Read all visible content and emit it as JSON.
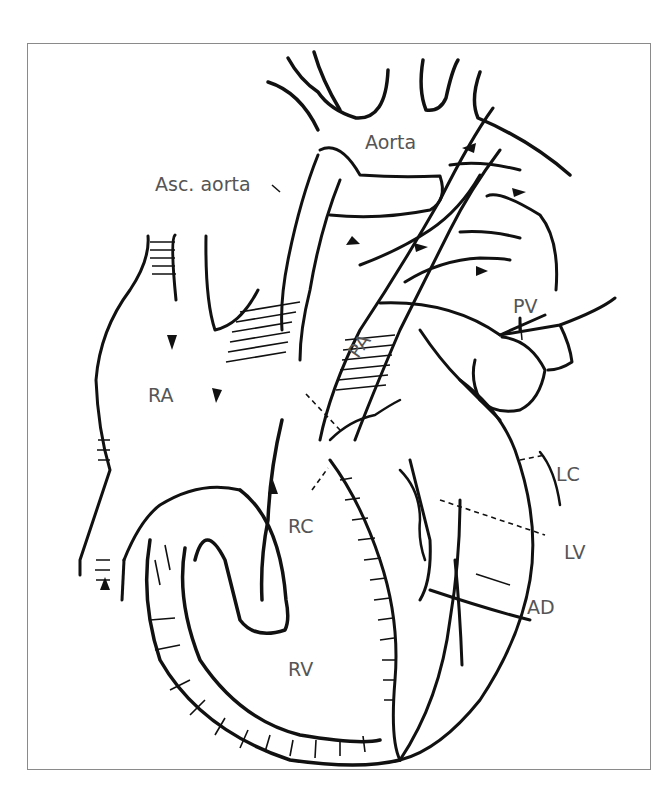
{
  "diagram": {
    "type": "anatomical-line-drawing",
    "labels": {
      "aorta": "Aorta",
      "asc_aorta": "Asc. aorta",
      "ra": "RA",
      "pa": "PA",
      "pv": "PV",
      "lc": "LC",
      "rc": "RC",
      "lv": "LV",
      "ad": "AD",
      "rv": "RV"
    },
    "colors": {
      "line": "#111111",
      "label": "#555555",
      "frame": "#8a8a8a",
      "background": "#ffffff"
    }
  }
}
